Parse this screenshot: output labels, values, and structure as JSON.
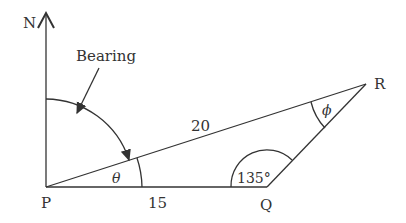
{
  "diagram": {
    "points": [
      {
        "id": "P",
        "label": "P"
      },
      {
        "id": "Q",
        "label": "Q"
      },
      {
        "id": "R",
        "label": "R"
      }
    ],
    "north_label": "N",
    "bearing_label": "Bearing",
    "side_labels": {
      "PR": "20",
      "PQ": "15"
    },
    "angle_labels": {
      "P": "θ",
      "Q": "135°",
      "R": "ϕ"
    },
    "colors": {
      "stroke": "#333333",
      "background": "#ffffff"
    }
  }
}
